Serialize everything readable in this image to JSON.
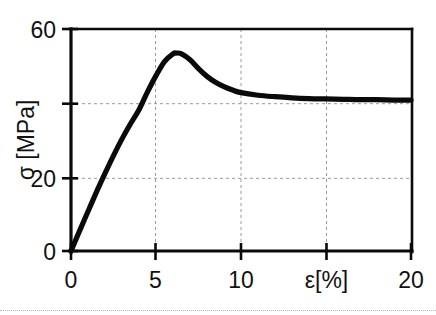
{
  "chart_data": {
    "type": "line",
    "title": "",
    "subtitle": "",
    "xlabel": "ε[%]",
    "ylabel": "σ [MPa]",
    "xlim": [
      0,
      20
    ],
    "ylim": [
      0,
      60
    ],
    "grid": true,
    "grid_color": "#9a9a9a",
    "legend": null,
    "line_color": "#0a0a0a",
    "background": "#ffffff",
    "x_ticks": [
      0,
      5,
      10,
      15,
      20
    ],
    "x_tick_labels": [
      "0",
      "5",
      "10",
      "ε[%]",
      "20"
    ],
    "y_ticks": [
      0,
      20,
      40,
      60
    ],
    "y_tick_labels": [
      "0",
      "20",
      "",
      "60"
    ],
    "x_gridlines": [
      5,
      10,
      15
    ],
    "y_gridlines": [
      20,
      40
    ],
    "series": [
      {
        "name": "stress-strain",
        "x": [
          0.0,
          0.4,
          0.8,
          1.2,
          1.6,
          2.0,
          2.5,
          3.0,
          3.5,
          4.0,
          4.5,
          5.0,
          5.5,
          6.0,
          6.2,
          6.5,
          7.0,
          7.5,
          8.0,
          8.5,
          9.0,
          9.5,
          10.0,
          11.0,
          12.0,
          13.0,
          14.0,
          15.0,
          16.0,
          17.0,
          18.0,
          19.0,
          20.0
        ],
        "y": [
          0.0,
          4.3,
          8.6,
          12.8,
          17.0,
          21.0,
          25.8,
          30.3,
          34.4,
          38.2,
          43.0,
          47.4,
          51.2,
          53.3,
          53.5,
          53.3,
          51.7,
          49.3,
          47.2,
          45.6,
          44.4,
          43.5,
          42.8,
          42.1,
          41.7,
          41.4,
          41.2,
          41.1,
          41.0,
          40.9,
          40.9,
          40.8,
          40.8
        ]
      }
    ],
    "annotations": {
      "peak_stress": 53.5,
      "peak_strain": 6.2,
      "final_stress": 40.8
    }
  },
  "figure": {
    "caption": "",
    "separator_visible": true
  }
}
